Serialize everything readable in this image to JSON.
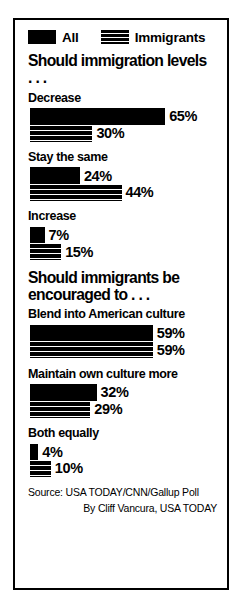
{
  "legend": {
    "items": [
      {
        "label": "All",
        "swatch": "solid-black-swatch-icon",
        "color": "#000000"
      },
      {
        "label": "Immigrants",
        "swatch": "striped-black-swatch-icon",
        "color": "#000000"
      }
    ]
  },
  "sections": [
    {
      "heading": "Should immigration levels . . .",
      "groups": [
        {
          "label": "Decrease",
          "bars": [
            {
              "series": "All",
              "value": 65,
              "value_label": "65%"
            },
            {
              "series": "Immigrants",
              "value": 30,
              "value_label": "30%"
            }
          ]
        },
        {
          "label": "Stay the same",
          "bars": [
            {
              "series": "All",
              "value": 24,
              "value_label": "24%"
            },
            {
              "series": "Immigrants",
              "value": 44,
              "value_label": "44%"
            }
          ]
        },
        {
          "label": "Increase",
          "bars": [
            {
              "series": "All",
              "value": 7,
              "value_label": "7%"
            },
            {
              "series": "Immigrants",
              "value": 15,
              "value_label": "15%"
            }
          ]
        }
      ]
    },
    {
      "heading": "Should immigrants be\nencouraged to . . .",
      "groups": [
        {
          "label": "Blend into American culture",
          "bars": [
            {
              "series": "All",
              "value": 59,
              "value_label": "59%"
            },
            {
              "series": "Immigrants",
              "value": 59,
              "value_label": "59%"
            }
          ]
        },
        {
          "label": "Maintain own culture more",
          "bars": [
            {
              "series": "All",
              "value": 32,
              "value_label": "32%"
            },
            {
              "series": "Immigrants",
              "value": 29,
              "value_label": "29%"
            }
          ]
        },
        {
          "label": "Both equally",
          "bars": [
            {
              "series": "All",
              "value": 4,
              "value_label": "4%"
            },
            {
              "series": "Immigrants",
              "value": 10,
              "value_label": "10%"
            }
          ]
        }
      ]
    }
  ],
  "footer": {
    "source": "Source: USA TODAY/CNN/Gallup Poll",
    "credit": "By Cliff Vancura, USA TODAY"
  },
  "chart_data": {
    "type": "bar",
    "title": "",
    "orientation": "horizontal",
    "grid": false,
    "legend_position": "top",
    "xlabel": "",
    "ylabel": "",
    "xlim": [
      0,
      65
    ],
    "unit": "percent",
    "px_per_percent": 2.08,
    "bar_origin_px": 28,
    "series": [
      {
        "name": "All",
        "style": "solid",
        "values": [
          65,
          24,
          7,
          59,
          32,
          4
        ]
      },
      {
        "name": "Immigrants",
        "style": "striped",
        "values": [
          30,
          44,
          15,
          59,
          29,
          10
        ]
      }
    ],
    "categories": [
      "Decrease",
      "Stay the same",
      "Increase",
      "Blend into American culture",
      "Maintain own culture more",
      "Both equally"
    ],
    "question_groups": [
      {
        "question": "Should immigration levels . . .",
        "categories": [
          "Decrease",
          "Stay the same",
          "Increase"
        ],
        "All": [
          65,
          24,
          7
        ],
        "Immigrants": [
          30,
          44,
          15
        ]
      },
      {
        "question": "Should immigrants be encouraged to . . .",
        "categories": [
          "Blend into American culture",
          "Maintain own culture more",
          "Both equally"
        ],
        "All": [
          59,
          32,
          4
        ],
        "Immigrants": [
          59,
          29,
          10
        ]
      }
    ],
    "source": "Source: USA TODAY/CNN/Gallup Poll",
    "credit": "By Cliff Vancura, USA TODAY"
  }
}
